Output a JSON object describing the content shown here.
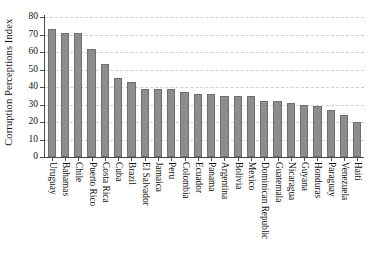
{
  "chart_data": {
    "type": "bar",
    "title": "",
    "xlabel": "",
    "ylabel": "Corruption Perceptions Index",
    "ylim": [
      0,
      80
    ],
    "yticks": [
      0,
      10,
      20,
      30,
      40,
      50,
      60,
      70,
      80
    ],
    "grid": true,
    "legend": null,
    "bar_color": "#8d8d8d",
    "bar_edge_color": "#6f6f6f",
    "categories": [
      "Uruguay",
      "Bahamas",
      "Chile",
      "Puerto Rico",
      "Costa Rica",
      "Cuba",
      "Brazil",
      "El Salvador",
      "Jamaica",
      "Peru",
      "Colombia",
      "Ecuador",
      "Panama",
      "Argentina",
      "Bolivia",
      "Mexico",
      "Dominican Republic",
      "Guatemala",
      "Nicaragua",
      "Guyana",
      "Honduras",
      "Paraguay",
      "Venezuela",
      "Haiti"
    ],
    "values": [
      73,
      71,
      71,
      62,
      53,
      45,
      43,
      39,
      39,
      39,
      37,
      36,
      36,
      35,
      35,
      35,
      32,
      32,
      31,
      30,
      29,
      27,
      24,
      20
    ]
  }
}
